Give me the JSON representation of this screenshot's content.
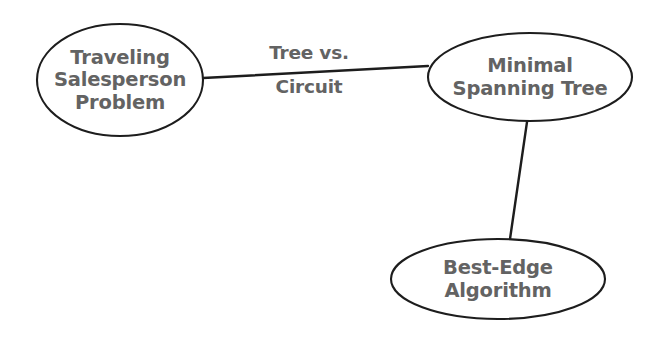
{
  "diagram": {
    "type": "concept-map",
    "background_color": "#ffffff",
    "node_stroke_color": "#1d1d1d",
    "node_fill_color": "#ffffff",
    "text_color": "#636363",
    "nodes": [
      {
        "id": "traveling-salesperson-problem",
        "label": "Traveling\nSalesperson\nProblem",
        "shape": "ellipse",
        "cx": 120,
        "cy": 80,
        "rx": 83,
        "ry": 56
      },
      {
        "id": "minimal-spanning-tree",
        "label": "Minimal\nSpanning Tree",
        "shape": "ellipse",
        "cx": 530,
        "cy": 77,
        "rx": 102,
        "ry": 44
      },
      {
        "id": "best-edge-algorithm",
        "label": "Best-Edge\nAlgorithm",
        "shape": "ellipse",
        "cx": 498,
        "cy": 279,
        "rx": 107,
        "ry": 40
      }
    ],
    "edges": [
      {
        "id": "tsp-to-mst",
        "from": "traveling-salesperson-problem",
        "to": "minimal-spanning-tree",
        "x1": 203,
        "y1": 78,
        "x2": 428,
        "y2": 66,
        "label_line1": "Tree vs.",
        "label_line2": "Circuit"
      },
      {
        "id": "mst-to-bea",
        "from": "minimal-spanning-tree",
        "to": "best-edge-algorithm",
        "x1": 527,
        "y1": 122,
        "x2": 510,
        "y2": 239,
        "label_line1": "",
        "label_line2": ""
      }
    ]
  }
}
